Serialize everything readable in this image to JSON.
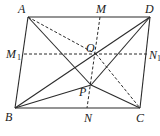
{
  "diagram": {
    "type": "geometry",
    "points": {
      "A": {
        "label": "A"
      },
      "B": {
        "label": "B"
      },
      "C": {
        "label": "C"
      },
      "D": {
        "label": "D"
      },
      "M": {
        "label": "M"
      },
      "N": {
        "label": "N"
      },
      "M1": {
        "label": "M",
        "subscript": "1"
      },
      "N1": {
        "label": "N",
        "subscript": "1"
      },
      "O": {
        "label": "O"
      },
      "P": {
        "label": "P"
      }
    },
    "solid_segments": [
      [
        "A",
        "D"
      ],
      [
        "A",
        "B"
      ],
      [
        "B",
        "C"
      ],
      [
        "C",
        "D"
      ],
      [
        "B",
        "D"
      ],
      [
        "D",
        "P"
      ],
      [
        "A",
        "P"
      ],
      [
        "B",
        "P"
      ],
      [
        "P",
        "C"
      ]
    ],
    "dashed_segments": [
      [
        "M",
        "N"
      ],
      [
        "M1",
        "N1"
      ],
      [
        "A",
        "O"
      ],
      [
        "O",
        "C"
      ]
    ],
    "line_color": "#2b2b2b"
  }
}
